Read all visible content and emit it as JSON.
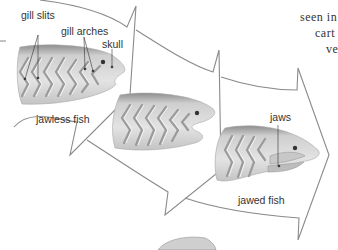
{
  "diagram": {
    "type": "evolution-flow",
    "stages": [
      {
        "label": "jawless fish"
      },
      {
        "label": ""
      },
      {
        "label": "jawed fish"
      }
    ],
    "annotations": {
      "gill_slits": "gill slits",
      "gill_arches": "gill arches",
      "skull": "skull",
      "jaws": "jaws"
    },
    "side_text": [
      "seen in",
      "cart",
      "ve"
    ],
    "colors": {
      "arrow_outline": "#8a8a8a",
      "fish_body": "#d9d9d9",
      "fish_shadow": "#b5b5b5",
      "fish_dark": "#7a7a7a",
      "label_text": "#333333"
    }
  }
}
